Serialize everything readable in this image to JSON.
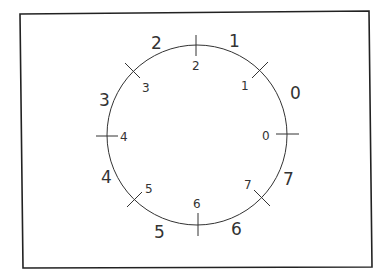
{
  "diagram": {
    "type": "circle-division",
    "tick_labels": [
      "0",
      "1",
      "2",
      "3",
      "4",
      "5",
      "6",
      "7"
    ],
    "sector_labels": [
      "0",
      "1",
      "2",
      "3",
      "4",
      "5",
      "6",
      "7"
    ]
  }
}
